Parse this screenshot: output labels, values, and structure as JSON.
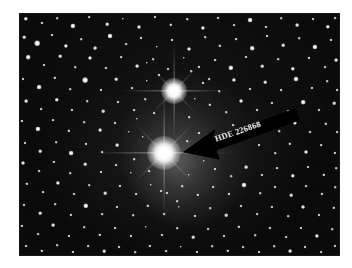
{
  "image": {
    "kind": "astronomical-photograph",
    "subject": "star-field",
    "frame": {
      "x": 19,
      "y": 13,
      "width": 321,
      "height": 243
    },
    "background_color": "#0a0a0a",
    "page_color": "#ffffff"
  },
  "annotation": {
    "label": "HDE 226868",
    "arrow_color": "#000000",
    "text_color": "#f2f2f2",
    "rotation_deg": -19,
    "tip": {
      "x": 165,
      "y": 139
    },
    "tail": {
      "x": 274,
      "y": 100
    }
  },
  "objects": [
    {
      "name": "HDE 226868",
      "role": "primary-target",
      "x": 145,
      "y": 140,
      "size": 34,
      "brightness": 1.0
    },
    {
      "name": "companion-bright-star",
      "role": "bright-star",
      "x": 155,
      "y": 78,
      "size": 26,
      "brightness": 0.9
    }
  ],
  "chart_data": {
    "type": "scatter",
    "xlabel": "",
    "ylabel": "",
    "note": "Wide-field photographic plate of the Cygnus X-1 region; arrow marks HDE 226868.",
    "bright_stars": [
      {
        "x": 145,
        "y": 140,
        "mag_rank": 1
      },
      {
        "x": 155,
        "y": 78,
        "mag_rank": 2
      }
    ],
    "field_stars": [
      [
        7,
        6,
        2.2
      ],
      [
        23,
        10,
        1.6
      ],
      [
        38,
        5,
        1.3
      ],
      [
        54,
        13,
        2.6
      ],
      [
        70,
        4,
        1.4
      ],
      [
        88,
        11,
        1.8
      ],
      [
        104,
        6,
        1.2
      ],
      [
        120,
        14,
        2.0
      ],
      [
        136,
        4,
        1.5
      ],
      [
        152,
        12,
        1.7
      ],
      [
        168,
        6,
        1.3
      ],
      [
        184,
        15,
        2.1
      ],
      [
        199,
        5,
        1.5
      ],
      [
        215,
        12,
        1.4
      ],
      [
        231,
        7,
        2.4
      ],
      [
        247,
        14,
        1.6
      ],
      [
        262,
        5,
        1.3
      ],
      [
        278,
        12,
        1.9
      ],
      [
        294,
        6,
        1.5
      ],
      [
        309,
        14,
        2.2
      ],
      [
        316,
        5,
        1.4
      ],
      [
        5,
        24,
        1.8
      ],
      [
        18,
        30,
        2.8
      ],
      [
        33,
        22,
        1.5
      ],
      [
        47,
        33,
        2.1
      ],
      [
        62,
        26,
        1.3
      ],
      [
        76,
        35,
        1.9
      ],
      [
        91,
        23,
        2.5
      ],
      [
        107,
        31,
        1.4
      ],
      [
        122,
        25,
        1.6
      ],
      [
        138,
        34,
        1.2
      ],
      [
        153,
        27,
        1.5
      ],
      [
        170,
        36,
        2.0
      ],
      [
        186,
        24,
        1.3
      ],
      [
        201,
        33,
        1.7
      ],
      [
        217,
        26,
        1.4
      ],
      [
        233,
        35,
        2.3
      ],
      [
        248,
        23,
        1.5
      ],
      [
        264,
        32,
        1.8
      ],
      [
        280,
        25,
        1.3
      ],
      [
        296,
        34,
        2.6
      ],
      [
        312,
        27,
        1.6
      ],
      [
        9,
        44,
        2.3
      ],
      [
        25,
        52,
        1.5
      ],
      [
        41,
        43,
        1.8
      ],
      [
        56,
        54,
        1.3
      ],
      [
        71,
        45,
        2.0
      ],
      [
        87,
        55,
        1.6
      ],
      [
        102,
        44,
        1.4
      ],
      [
        118,
        53,
        1.9
      ],
      [
        134,
        46,
        1.3
      ],
      [
        149,
        56,
        1.5
      ],
      [
        165,
        45,
        1.2
      ],
      [
        180,
        54,
        1.6
      ],
      [
        196,
        47,
        1.4
      ],
      [
        212,
        55,
        2.7
      ],
      [
        227,
        44,
        1.5
      ],
      [
        243,
        53,
        1.8
      ],
      [
        259,
        46,
        1.3
      ],
      [
        274,
        56,
        2.2
      ],
      [
        290,
        45,
        1.6
      ],
      [
        306,
        54,
        1.4
      ],
      [
        317,
        47,
        1.9
      ],
      [
        4,
        66,
        1.5
      ],
      [
        20,
        74,
        2.4
      ],
      [
        36,
        65,
        1.7
      ],
      [
        51,
        76,
        1.3
      ],
      [
        66,
        67,
        2.9
      ],
      [
        82,
        77,
        1.5
      ],
      [
        97,
        66,
        1.8
      ],
      [
        113,
        75,
        1.4
      ],
      [
        128,
        68,
        1.2
      ],
      [
        184,
        70,
        1.6
      ],
      [
        200,
        78,
        1.3
      ],
      [
        215,
        67,
        2.1
      ],
      [
        231,
        76,
        1.5
      ],
      [
        246,
        69,
        1.8
      ],
      [
        262,
        77,
        1.4
      ],
      [
        277,
        66,
        2.5
      ],
      [
        293,
        75,
        1.6
      ],
      [
        308,
        68,
        1.3
      ],
      [
        318,
        77,
        1.5
      ],
      [
        7,
        88,
        1.9
      ],
      [
        22,
        96,
        1.4
      ],
      [
        38,
        87,
        2.2
      ],
      [
        53,
        97,
        1.6
      ],
      [
        68,
        88,
        1.3
      ],
      [
        84,
        98,
        1.8
      ],
      [
        99,
        89,
        1.5
      ],
      [
        115,
        97,
        1.4
      ],
      [
        191,
        92,
        1.7
      ],
      [
        207,
        99,
        1.3
      ],
      [
        222,
        88,
        2.0
      ],
      [
        238,
        97,
        1.5
      ],
      [
        253,
        90,
        1.6
      ],
      [
        269,
        98,
        1.3
      ],
      [
        284,
        89,
        2.3
      ],
      [
        300,
        97,
        1.5
      ],
      [
        315,
        90,
        1.8
      ],
      [
        3,
        108,
        1.6
      ],
      [
        19,
        116,
        2.6
      ],
      [
        34,
        107,
        1.4
      ],
      [
        50,
        118,
        1.7
      ],
      [
        65,
        109,
        1.3
      ],
      [
        81,
        117,
        1.9
      ],
      [
        96,
        110,
        1.5
      ],
      [
        110,
        119,
        1.2
      ],
      [
        214,
        112,
        1.4
      ],
      [
        229,
        120,
        1.6
      ],
      [
        245,
        109,
        1.8
      ],
      [
        260,
        118,
        1.3
      ],
      [
        276,
        110,
        2.1
      ],
      [
        291,
        119,
        1.5
      ],
      [
        307,
        111,
        1.7
      ],
      [
        318,
        119,
        1.4
      ],
      [
        6,
        130,
        1.5
      ],
      [
        21,
        138,
        1.8
      ],
      [
        37,
        129,
        1.3
      ],
      [
        52,
        140,
        2.4
      ],
      [
        67,
        131,
        1.6
      ],
      [
        83,
        139,
        1.4
      ],
      [
        98,
        132,
        1.9
      ],
      [
        240,
        132,
        1.5
      ],
      [
        256,
        140,
        1.3
      ],
      [
        271,
        131,
        1.7
      ],
      [
        287,
        139,
        2.0
      ],
      [
        302,
        132,
        1.4
      ],
      [
        316,
        140,
        1.6
      ],
      [
        4,
        150,
        2.0
      ],
      [
        20,
        158,
        1.4
      ],
      [
        35,
        149,
        1.6
      ],
      [
        51,
        160,
        1.3
      ],
      [
        66,
        151,
        1.8
      ],
      [
        82,
        159,
        1.5
      ],
      [
        97,
        152,
        1.4
      ],
      [
        112,
        160,
        1.2
      ],
      [
        196,
        156,
        1.5
      ],
      [
        212,
        163,
        1.3
      ],
      [
        227,
        154,
        1.9
      ],
      [
        243,
        162,
        1.6
      ],
      [
        258,
        155,
        1.4
      ],
      [
        274,
        163,
        2.2
      ],
      [
        289,
        154,
        1.5
      ],
      [
        305,
        162,
        1.7
      ],
      [
        317,
        155,
        1.3
      ],
      [
        8,
        171,
        1.7
      ],
      [
        24,
        179,
        1.4
      ],
      [
        39,
        170,
        2.1
      ],
      [
        55,
        181,
        1.5
      ],
      [
        70,
        172,
        1.3
      ],
      [
        86,
        180,
        1.8
      ],
      [
        101,
        173,
        1.6
      ],
      [
        117,
        181,
        1.4
      ],
      [
        132,
        172,
        1.2
      ],
      [
        148,
        180,
        1.5
      ],
      [
        163,
        173,
        1.3
      ],
      [
        179,
        182,
        1.7
      ],
      [
        194,
        174,
        1.4
      ],
      [
        210,
        181,
        1.6
      ],
      [
        225,
        172,
        2.5
      ],
      [
        241,
        180,
        1.3
      ],
      [
        256,
        174,
        1.5
      ],
      [
        272,
        182,
        1.8
      ],
      [
        287,
        173,
        1.4
      ],
      [
        303,
        181,
        1.6
      ],
      [
        316,
        174,
        1.3
      ],
      [
        5,
        192,
        1.5
      ],
      [
        21,
        200,
        1.8
      ],
      [
        36,
        191,
        1.3
      ],
      [
        52,
        202,
        1.6
      ],
      [
        67,
        193,
        2.7
      ],
      [
        83,
        201,
        1.4
      ],
      [
        98,
        194,
        1.5
      ],
      [
        114,
        202,
        1.3
      ],
      [
        129,
        193,
        1.7
      ],
      [
        145,
        201,
        1.4
      ],
      [
        160,
        194,
        1.2
      ],
      [
        176,
        203,
        1.6
      ],
      [
        191,
        195,
        1.3
      ],
      [
        207,
        202,
        1.8
      ],
      [
        222,
        193,
        1.5
      ],
      [
        238,
        201,
        1.4
      ],
      [
        253,
        194,
        1.6
      ],
      [
        269,
        203,
        1.3
      ],
      [
        284,
        194,
        2.0
      ],
      [
        300,
        202,
        1.5
      ],
      [
        315,
        195,
        1.7
      ],
      [
        3,
        213,
        1.6
      ],
      [
        19,
        221,
        1.4
      ],
      [
        34,
        212,
        1.9
      ],
      [
        50,
        223,
        1.5
      ],
      [
        65,
        214,
        1.3
      ],
      [
        81,
        222,
        1.7
      ],
      [
        96,
        215,
        1.4
      ],
      [
        112,
        223,
        1.6
      ],
      [
        127,
        214,
        1.2
      ],
      [
        143,
        222,
        1.5
      ],
      [
        158,
        215,
        1.3
      ],
      [
        174,
        224,
        1.8
      ],
      [
        189,
        216,
        1.4
      ],
      [
        205,
        223,
        1.5
      ],
      [
        220,
        214,
        1.7
      ],
      [
        236,
        222,
        1.3
      ],
      [
        251,
        215,
        1.6
      ],
      [
        267,
        224,
        1.4
      ],
      [
        282,
        215,
        1.5
      ],
      [
        298,
        223,
        2.1
      ],
      [
        313,
        216,
        1.3
      ],
      [
        7,
        233,
        1.5
      ],
      [
        23,
        238,
        1.7
      ],
      [
        38,
        232,
        1.3
      ],
      [
        54,
        239,
        1.6
      ],
      [
        69,
        233,
        1.4
      ],
      [
        85,
        238,
        1.8
      ],
      [
        100,
        234,
        1.5
      ],
      [
        116,
        239,
        1.3
      ],
      [
        131,
        233,
        1.6
      ],
      [
        147,
        238,
        1.4
      ],
      [
        162,
        234,
        1.2
      ],
      [
        178,
        239,
        1.5
      ],
      [
        193,
        233,
        1.3
      ],
      [
        209,
        238,
        1.7
      ],
      [
        224,
        234,
        1.4
      ],
      [
        240,
        239,
        1.5
      ],
      [
        255,
        233,
        1.3
      ],
      [
        271,
        238,
        1.9
      ],
      [
        286,
        234,
        1.5
      ],
      [
        302,
        239,
        1.4
      ],
      [
        316,
        233,
        1.6
      ],
      [
        135,
        100,
        1.4
      ],
      [
        118,
        106,
        1.2
      ],
      [
        170,
        104,
        1.3
      ],
      [
        180,
        120,
        1.5
      ],
      [
        124,
        124,
        1.2
      ],
      [
        168,
        128,
        1.3
      ],
      [
        130,
        158,
        1.4
      ],
      [
        170,
        162,
        1.2
      ],
      [
        115,
        146,
        1.3
      ],
      [
        185,
        148,
        1.2
      ],
      [
        142,
        178,
        1.5
      ],
      [
        158,
        188,
        1.3
      ],
      [
        126,
        86,
        1.3
      ],
      [
        176,
        86,
        1.2
      ],
      [
        140,
        62,
        1.5
      ],
      [
        172,
        58,
        1.3
      ],
      [
        190,
        66,
        1.4
      ],
      [
        128,
        50,
        1.2
      ]
    ]
  }
}
